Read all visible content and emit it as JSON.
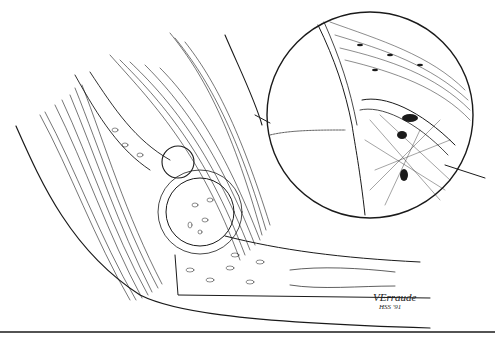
{
  "illustration": {
    "subject": "Sagittal line drawing of a hip/shoulder joint with muscles, bone shaft, and a circular magnified inset of the capsule/bone interface",
    "signature": {
      "name": "VErraude",
      "date": "HSS '91"
    },
    "colors": {
      "ink": "#1a1a1a",
      "background": "#ffffff"
    }
  }
}
